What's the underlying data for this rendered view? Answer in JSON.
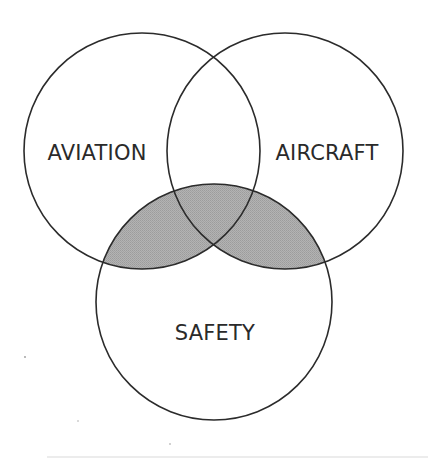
{
  "diagram": {
    "type": "venn-3",
    "colors": {
      "background": "#ffffff",
      "outline": "#2b2b2b",
      "shade": "#a9a9a9",
      "label": "#2a2a2a"
    },
    "sets": [
      {
        "id": "aviation",
        "label": "AVIATION",
        "cx": 142,
        "cy": 151,
        "r": 118,
        "label_x": 97,
        "label_y": 160
      },
      {
        "id": "aircraft",
        "label": "AIRCRAFT",
        "cx": 285,
        "cy": 151,
        "r": 118,
        "label_x": 327,
        "label_y": 160
      },
      {
        "id": "safety",
        "label": "SAFETY",
        "cx": 214,
        "cy": 302,
        "r": 118,
        "label_x": 215,
        "label_y": 340
      }
    ],
    "shaded_regions": [
      "AVIATION ∩ SAFETY",
      "AIRCRAFT ∩ SAFETY"
    ],
    "shaded_description": "SAFETY ∩ (AVIATION ∪ AIRCRAFT)"
  }
}
